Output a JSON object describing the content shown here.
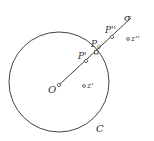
{
  "diagram": {
    "circle_label": "C",
    "center_label": "O",
    "ray_label": "σ",
    "points": {
      "p0": "P",
      "p0_sub": "0",
      "p_prime": "P'",
      "p_double": "P''",
      "z_prime": "z'",
      "z_double": "z''"
    },
    "stroke_color": "#444444"
  }
}
